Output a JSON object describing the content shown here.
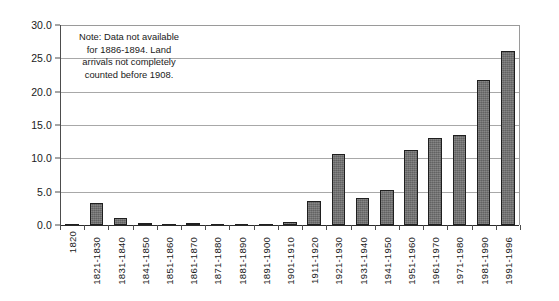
{
  "chart_data": {
    "type": "bar",
    "title": "",
    "subtitle": "",
    "xlabel": "",
    "ylabel": "",
    "ylim": [
      0.0,
      30.0
    ],
    "ytick_labels": [
      "0.0",
      "5.0",
      "10.0",
      "15.0",
      "20.0",
      "25.0",
      "30.0"
    ],
    "ytick_values": [
      0.0,
      5.0,
      10.0,
      15.0,
      20.0,
      25.0,
      30.0
    ],
    "grid": "horizontal",
    "legend": "none",
    "categories": [
      "1820",
      "1821-1830",
      "1831-1840",
      "1841-1850",
      "1851-1860",
      "1861-1870",
      "1871-1880",
      "1881-1890",
      "1891-1900",
      "1901-1910",
      "1911-1920",
      "1921-1930",
      "1931-1940",
      "1941-1950",
      "1951-1960",
      "1961-1970",
      "1971-1980",
      "1981-1990",
      "1991-1996"
    ],
    "values": [
      0.0,
      3.3,
      1.0,
      0.1,
      0.0,
      0.15,
      0.0,
      0.0,
      0.0,
      0.5,
      3.6,
      10.7,
      4.0,
      5.2,
      11.3,
      13.0,
      13.5,
      21.7,
      26.1
    ],
    "annotations": [
      {
        "name": "data-availability-note",
        "lines": [
          "Note: Data not available",
          "for 1886-1894.  Land",
          "arrivals not completely",
          "counted before 1908."
        ]
      }
    ],
    "colors": {
      "bar_fill": "#6e6e6e",
      "bar_border": "#1f1f1f",
      "gridline": "#a8a8a8",
      "axis": "#4d4d4d",
      "baseline": "#2b2b2b",
      "text": "#1a1a1a",
      "background": "#ffffff"
    }
  }
}
